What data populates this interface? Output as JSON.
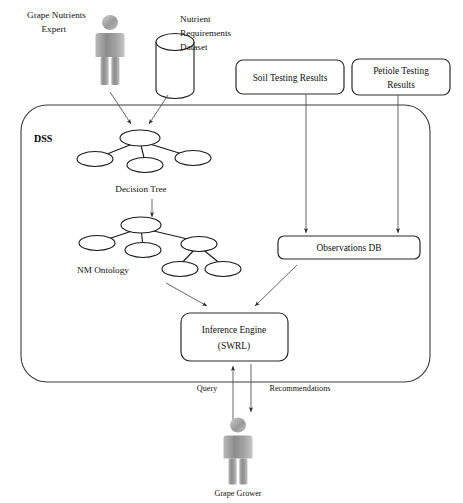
{
  "diagram": {
    "type": "architecture-flow-diagram",
    "background_color": "#ffffff",
    "line_color": "#333333",
    "actors": [
      {
        "id": "grape-nutrients-expert",
        "label_line1": "Grape Nutrients",
        "label_line2": "Expert",
        "icon": "person-icon",
        "position": "top-left"
      },
      {
        "id": "grape-grower",
        "label": "Grape Grower",
        "icon": "person-icon",
        "position": "bottom-center"
      }
    ],
    "datastores": [
      {
        "id": "nutrient-requirements-dataset",
        "label_line1": "Nutrient",
        "label_line2": "Requirements",
        "label_line3": "Dataset",
        "icon": "database-cylinder-icon",
        "position": "top-center"
      }
    ],
    "boundary": {
      "id": "dss-boundary",
      "label": "DSS",
      "shape": "rounded-rectangle"
    },
    "boxes": [
      {
        "id": "soil-testing-results",
        "label_line1": "Soil Testing Results",
        "label_line2": ""
      },
      {
        "id": "petiole-testing-results",
        "label_line1": "Petiole Testing",
        "label_line2": "Results"
      },
      {
        "id": "observations-db",
        "label_line1": "Observations DB",
        "label_line2": ""
      },
      {
        "id": "inference-engine",
        "label_line1": "Inference Engine",
        "label_line2": "(SWRL)"
      }
    ],
    "trees": [
      {
        "id": "decision-tree",
        "label": "Decision Tree",
        "node_count": 4
      },
      {
        "id": "nm-ontology",
        "label": "NM Ontology",
        "node_count": 6
      }
    ],
    "edge_labels": [
      {
        "id": "query-label",
        "label": "Query"
      },
      {
        "id": "recommendations-label",
        "label": "Recommendations"
      }
    ]
  }
}
